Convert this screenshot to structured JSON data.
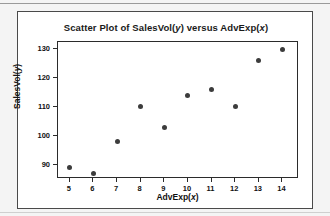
{
  "figure": {
    "title_prefix": "Scatter Plot of SalesVol(",
    "title_y_var": "y",
    "title_mid": ") versus AdvExp(",
    "title_x_var": "x",
    "title_suffix": ")",
    "title_full": "Scatter Plot of SalesVol(y) versus AdvExp(x)",
    "xlabel_prefix": "AdvExp(",
    "xlabel_var": "x",
    "xlabel_suffix": ")",
    "ylabel_prefix": "SalesVol(",
    "ylabel_var": "y",
    "ylabel_suffix": ")",
    "marker_color": "#3c3c3c",
    "frame_color": "#2b2b2b",
    "background_color": "#ffffff",
    "page_background_color": "#f4f4f4"
  },
  "chart_data": {
    "type": "scatter",
    "title": "Scatter Plot of SalesVol(y) versus AdvExp(x)",
    "xlabel": "AdvExp(x)",
    "ylabel": "SalesVol(y)",
    "x": [
      5,
      6,
      7,
      8,
      9,
      10,
      11,
      12,
      13,
      14
    ],
    "y": [
      89,
      87,
      98,
      110,
      103,
      114,
      116,
      110,
      126,
      130
    ],
    "points": [
      {
        "x": 5,
        "y": 89
      },
      {
        "x": 6,
        "y": 87
      },
      {
        "x": 7,
        "y": 98
      },
      {
        "x": 8,
        "y": 110
      },
      {
        "x": 9,
        "y": 103
      },
      {
        "x": 10,
        "y": 114
      },
      {
        "x": 11,
        "y": 116
      },
      {
        "x": 12,
        "y": 110
      },
      {
        "x": 13,
        "y": 126
      },
      {
        "x": 14,
        "y": 130
      }
    ],
    "xticks": [
      5,
      6,
      7,
      8,
      9,
      10,
      11,
      12,
      13,
      14
    ],
    "xtick_labels": [
      "5",
      "6",
      "7",
      "8",
      "9",
      "10",
      "11",
      "12",
      "13",
      "14"
    ],
    "yticks": [
      90,
      100,
      110,
      120,
      130
    ],
    "ytick_labels": [
      "90",
      "100",
      "110",
      "120",
      "130"
    ],
    "xlim": [
      4.5,
      14.7
    ],
    "ylim": [
      85.0,
      132.5
    ],
    "grid": false,
    "legend": false,
    "series": [
      {
        "name": "SalesVol",
        "values": [
          89,
          87,
          98,
          110,
          103,
          114,
          116,
          110,
          126,
          130
        ]
      }
    ]
  }
}
